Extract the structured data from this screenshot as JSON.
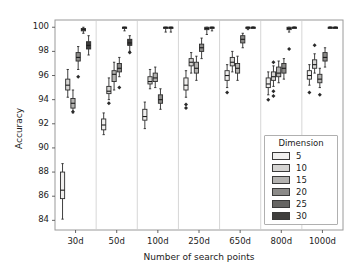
{
  "chart_data": {
    "type": "box",
    "title": "",
    "xlabel": "Number of search points",
    "ylabel": "Accuracy",
    "ylim": [
      83.2,
      100.6
    ],
    "yticks": [
      84,
      86,
      88,
      90,
      92,
      94,
      96,
      98,
      100
    ],
    "categories": [
      "30d",
      "50d",
      "100d",
      "250d",
      "650d",
      "800d",
      "1000d"
    ],
    "grid": "vertical-separators-only",
    "legend": {
      "title": "Dimension",
      "position": "lower-right-inside",
      "entries": [
        {
          "label": "5",
          "color": "#f0efee"
        },
        {
          "label": "10",
          "color": "#d5d4d2"
        },
        {
          "label": "15",
          "color": "#b3b2b0"
        },
        {
          "label": "20",
          "color": "#8b8a88"
        },
        {
          "label": "25",
          "color": "#666563"
        },
        {
          "label": "30",
          "color": "#3f3e3d"
        }
      ]
    },
    "series": [
      {
        "name": "5",
        "color": "#f0efee",
        "boxes": [
          {
            "category": "30d",
            "whisker_low": 84.1,
            "q1": 85.8,
            "median": 86.5,
            "q3": 88.0,
            "whisker_high": 88.7,
            "outliers": []
          },
          {
            "category": "50d",
            "whisker_low": 91.1,
            "q1": 91.5,
            "median": 91.9,
            "q3": 92.4,
            "whisker_high": 92.9,
            "outliers": []
          },
          {
            "category": "100d",
            "whisker_low": 91.6,
            "q1": 92.3,
            "median": 92.6,
            "q3": 93.2,
            "whisker_high": 93.8,
            "outliers": []
          },
          {
            "category": "250d",
            "whisker_low": 94.2,
            "q1": 94.8,
            "median": 95.2,
            "q3": 95.8,
            "whisker_high": 96.4,
            "outliers": [
              93.6,
              93.3
            ]
          },
          {
            "category": "650d",
            "whisker_low": 95.0,
            "q1": 95.6,
            "median": 96.0,
            "q3": 96.4,
            "whisker_high": 96.9,
            "outliers": [
              94.6
            ]
          },
          {
            "category": "800d",
            "whisker_low": 94.4,
            "q1": 95.0,
            "median": 95.3,
            "q3": 95.8,
            "whisker_high": 96.3,
            "outliers": [
              94.0
            ]
          },
          {
            "category": "1000d",
            "whisker_low": 95.2,
            "q1": 95.7,
            "median": 96.0,
            "q3": 96.4,
            "whisker_high": 96.9,
            "outliers": [
              94.6
            ]
          }
        ]
      },
      {
        "name": "10",
        "color": "#d5d4d2",
        "boxes": [
          {
            "category": "30d",
            "whisker_low": 94.2,
            "q1": 94.8,
            "median": 95.2,
            "q3": 95.7,
            "whisker_high": 96.5,
            "outliers": []
          },
          {
            "category": "50d",
            "whisker_low": 94.0,
            "q1": 94.5,
            "median": 94.7,
            "q3": 95.1,
            "whisker_high": 95.8,
            "outliers": [
              93.7
            ]
          },
          {
            "category": "100d",
            "whisker_low": 94.9,
            "q1": 95.3,
            "median": 95.5,
            "q3": 95.9,
            "whisker_high": 96.5,
            "outliers": []
          },
          {
            "category": "250d",
            "whisker_low": 96.2,
            "q1": 96.8,
            "median": 97.1,
            "q3": 97.4,
            "whisker_high": 97.9,
            "outliers": []
          },
          {
            "category": "650d",
            "whisker_low": 96.3,
            "q1": 96.8,
            "median": 97.1,
            "q3": 97.5,
            "whisker_high": 98.0,
            "outliers": []
          },
          {
            "category": "800d",
            "whisker_low": 95.1,
            "q1": 95.6,
            "median": 95.9,
            "q3": 96.3,
            "whisker_high": 96.8,
            "outliers": [
              97.1,
              94.7,
              94.3
            ]
          },
          {
            "category": "1000d",
            "whisker_low": 96.2,
            "q1": 96.6,
            "median": 96.9,
            "q3": 97.3,
            "whisker_high": 97.8,
            "outliers": [
              98.5
            ]
          }
        ]
      },
      {
        "name": "15",
        "color": "#b3b2b0",
        "boxes": [
          {
            "category": "30d",
            "whisker_low": 92.9,
            "q1": 93.3,
            "median": 93.7,
            "q3": 94.1,
            "whisker_high": 94.8,
            "outliers": [
              93.0
            ]
          },
          {
            "category": "50d",
            "whisker_low": 94.8,
            "q1": 95.5,
            "median": 96.1,
            "q3": 96.4,
            "whisker_high": 97.1,
            "outliers": []
          },
          {
            "category": "100d",
            "whisker_low": 95.0,
            "q1": 95.5,
            "median": 95.8,
            "q3": 96.2,
            "whisker_high": 96.7,
            "outliers": []
          },
          {
            "category": "250d",
            "whisker_low": 95.6,
            "q1": 96.2,
            "median": 96.6,
            "q3": 97.1,
            "whisker_high": 97.6,
            "outliers": []
          },
          {
            "category": "650d",
            "whisker_low": 95.6,
            "q1": 96.2,
            "median": 96.6,
            "q3": 97.0,
            "whisker_high": 97.6,
            "outliers": []
          },
          {
            "category": "800d",
            "whisker_low": 95.4,
            "q1": 95.9,
            "median": 96.2,
            "q3": 96.7,
            "whisker_high": 97.2,
            "outliers": []
          },
          {
            "category": "1000d",
            "whisker_low": 95.0,
            "q1": 95.4,
            "median": 95.7,
            "q3": 96.1,
            "whisker_high": 96.6,
            "outliers": [
              94.4
            ]
          }
        ]
      },
      {
        "name": "20",
        "color": "#8b8a88",
        "boxes": [
          {
            "category": "30d",
            "whisker_low": 96.5,
            "q1": 97.2,
            "median": 97.5,
            "q3": 97.9,
            "whisker_high": 98.4,
            "outliers": [
              95.9
            ]
          },
          {
            "category": "50d",
            "whisker_low": 95.9,
            "q1": 96.3,
            "median": 96.6,
            "q3": 97.0,
            "whisker_high": 97.5,
            "outliers": [
              95.0
            ]
          },
          {
            "category": "100d",
            "whisker_low": 93.2,
            "q1": 93.7,
            "median": 94.0,
            "q3": 94.4,
            "whisker_high": 94.9,
            "outliers": []
          },
          {
            "category": "250d",
            "whisker_low": 97.4,
            "q1": 98.0,
            "median": 98.3,
            "q3": 98.6,
            "whisker_high": 99.1,
            "outliers": []
          },
          {
            "category": "650d",
            "whisker_low": 98.3,
            "q1": 98.7,
            "median": 99.0,
            "q3": 99.3,
            "whisker_high": 99.5,
            "outliers": []
          },
          {
            "category": "800d",
            "whisker_low": 95.7,
            "q1": 96.2,
            "median": 96.6,
            "q3": 97.0,
            "whisker_high": 97.4,
            "outliers": []
          },
          {
            "category": "1000d",
            "whisker_low": 96.7,
            "q1": 97.2,
            "median": 97.5,
            "q3": 97.9,
            "whisker_high": 98.3,
            "outliers": []
          }
        ]
      },
      {
        "name": "25",
        "color": "#666563",
        "boxes": [
          {
            "category": "30d",
            "whisker_low": 99.5,
            "q1": 99.7,
            "median": 99.8,
            "q3": 99.9,
            "whisker_high": 100.0,
            "outliers": []
          },
          {
            "category": "50d",
            "whisker_low": 99.7,
            "q1": 99.9,
            "median": 100.0,
            "q3": 100.0,
            "whisker_high": 100.0,
            "outliers": []
          },
          {
            "category": "100d",
            "whisker_low": 99.6,
            "q1": 99.9,
            "median": 100.0,
            "q3": 100.0,
            "whisker_high": 100.0,
            "outliers": []
          },
          {
            "category": "250d",
            "whisker_low": 99.4,
            "q1": 99.8,
            "median": 99.9,
            "q3": 100.0,
            "whisker_high": 100.0,
            "outliers": []
          },
          {
            "category": "650d",
            "whisker_low": 99.8,
            "q1": 99.9,
            "median": 100.0,
            "q3": 100.0,
            "whisker_high": 100.0,
            "outliers": []
          },
          {
            "category": "800d",
            "whisker_low": 99.6,
            "q1": 99.8,
            "median": 99.9,
            "q3": 100.0,
            "whisker_high": 100.0,
            "outliers": [
              98.2
            ]
          },
          {
            "category": "1000d",
            "whisker_low": 100.0,
            "q1": 100.0,
            "median": 100.0,
            "q3": 100.0,
            "whisker_high": 100.0,
            "outliers": []
          }
        ]
      },
      {
        "name": "30",
        "color": "#3f3e3d",
        "boxes": [
          {
            "category": "30d",
            "whisker_low": 97.7,
            "q1": 98.2,
            "median": 98.5,
            "q3": 98.8,
            "whisker_high": 99.3,
            "outliers": []
          },
          {
            "category": "50d",
            "whisker_low": 98.0,
            "q1": 98.5,
            "median": 98.7,
            "q3": 99.0,
            "whisker_high": 99.3,
            "outliers": [
              97.9
            ]
          },
          {
            "category": "100d",
            "whisker_low": 99.6,
            "q1": 99.9,
            "median": 100.0,
            "q3": 100.0,
            "whisker_high": 100.0,
            "outliers": []
          },
          {
            "category": "250d",
            "whisker_low": 99.7,
            "q1": 99.9,
            "median": 100.0,
            "q3": 100.0,
            "whisker_high": 100.0,
            "outliers": []
          },
          {
            "category": "650d",
            "whisker_low": 100.0,
            "q1": 100.0,
            "median": 100.0,
            "q3": 100.0,
            "whisker_high": 100.0,
            "outliers": []
          },
          {
            "category": "800d",
            "whisker_low": 100.0,
            "q1": 100.0,
            "median": 100.0,
            "q3": 100.0,
            "whisker_high": 100.0,
            "outliers": []
          },
          {
            "category": "1000d",
            "whisker_low": 100.0,
            "q1": 100.0,
            "median": 100.0,
            "q3": 100.0,
            "whisker_high": 100.0,
            "outliers": []
          }
        ]
      }
    ]
  }
}
